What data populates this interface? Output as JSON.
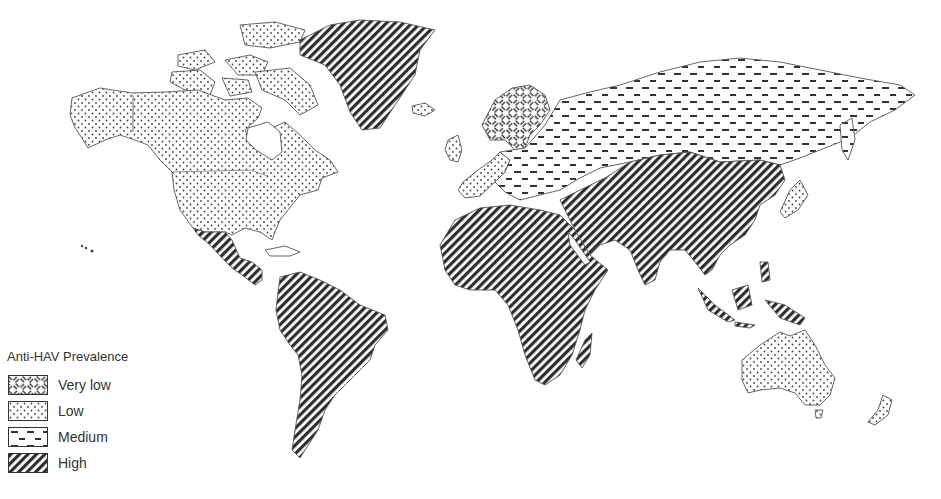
{
  "legend": {
    "title": "Anti-HAV Prevalence",
    "items": [
      {
        "label": "Very low",
        "pattern": "basketweave"
      },
      {
        "label": "Low",
        "pattern": "dots"
      },
      {
        "label": "Medium",
        "pattern": "dashes"
      },
      {
        "label": "High",
        "pattern": "diagonal-hatch"
      }
    ]
  },
  "map": {
    "type": "world-choropleth",
    "subject": "Anti-HAV Prevalence",
    "regions": [
      {
        "name": "North America (USA, Canada, Alaska)",
        "level": "Low"
      },
      {
        "name": "Greenland",
        "level": "High"
      },
      {
        "name": "Mexico & Central America",
        "level": "High"
      },
      {
        "name": "South America",
        "level": "High"
      },
      {
        "name": "Scandinavia",
        "level": "Very low"
      },
      {
        "name": "Western Europe",
        "level": "Low"
      },
      {
        "name": "Eastern Europe",
        "level": "Medium"
      },
      {
        "name": "Russia",
        "level": "Medium"
      },
      {
        "name": "Africa",
        "level": "High"
      },
      {
        "name": "Middle East",
        "level": "High"
      },
      {
        "name": "Central & South Asia",
        "level": "High"
      },
      {
        "name": "China",
        "level": "High"
      },
      {
        "name": "Southeast Asia",
        "level": "High"
      },
      {
        "name": "Japan",
        "level": "Low"
      },
      {
        "name": "Australia",
        "level": "Low"
      },
      {
        "name": "New Zealand",
        "level": "Low"
      }
    ]
  },
  "colors": {
    "ink": "#333333",
    "background": "#ffffff"
  }
}
